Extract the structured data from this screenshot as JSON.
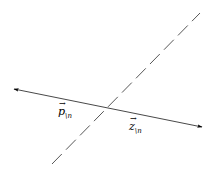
{
  "diagram": {
    "background": "#ffffff",
    "stroke_color": "#000000",
    "solid_arrow": {
      "x1": 14,
      "y1": 89,
      "x2": 202,
      "y2": 127,
      "style": "solid",
      "heads": "both"
    },
    "dashed_line": {
      "x1": 52,
      "y1": 164,
      "x2": 200,
      "y2": 13,
      "style": "long-dash"
    },
    "labels": [
      {
        "id": "p",
        "symbol": "p",
        "vec": "→",
        "subscript": "\\n",
        "x": 58,
        "y": 106
      },
      {
        "id": "z",
        "symbol": "z",
        "vec": "→",
        "subscript": "\\n",
        "x": 129,
        "y": 121
      }
    ]
  }
}
